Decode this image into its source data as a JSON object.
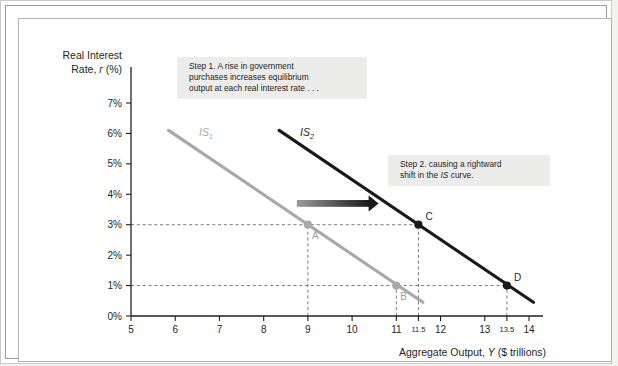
{
  "chart_data": {
    "type": "line",
    "title": "",
    "xlabel": "Aggregate Output, Y ($ trillions)",
    "xlabel_plain": "Aggregate Output,",
    "xlabel_italic": "Y",
    "xlabel_tail": "($ trillions)",
    "ylabel_line1": "Real Interest",
    "ylabel_line2_plain": "Rate,",
    "ylabel_line2_italic": "r",
    "ylabel_line2_tail": "(%)",
    "xlim": [
      5,
      14
    ],
    "ylim": [
      0,
      7
    ],
    "grid": false,
    "legend_position": "inline-curve-labels",
    "xticks": [
      5,
      6,
      7,
      8,
      9,
      10,
      11,
      12,
      13,
      14
    ],
    "xticklabels": [
      "5",
      "6",
      "7",
      "8",
      "9",
      "10",
      "11",
      "12",
      "13",
      "14"
    ],
    "xminorticks": [
      11.5,
      13.5
    ],
    "xminorticklabels": [
      "11.5",
      "13.5"
    ],
    "yticks": [
      0,
      1,
      2,
      3,
      4,
      5,
      6,
      7
    ],
    "yticklabels": [
      "0%",
      "1%",
      "2%",
      "3%",
      "4%",
      "5%",
      "6%",
      "7%"
    ],
    "series": [
      {
        "name": "IS1",
        "label_plain": "IS",
        "label_sub": "1",
        "color": "#a8a8a8",
        "x": [
          5.85,
          11.6
        ],
        "y": [
          6.1,
          0.45
        ]
      },
      {
        "name": "IS2",
        "label_plain": "IS",
        "label_sub": "2",
        "color": "#1a1a1a",
        "x": [
          8.35,
          14.1
        ],
        "y": [
          6.1,
          0.45
        ]
      }
    ],
    "points": [
      {
        "name": "A",
        "label": "A",
        "x": 9,
        "y": 3,
        "color": "#a8a8a8",
        "label_color": "#9a9a9a",
        "label_dx": 4,
        "label_dy": 14
      },
      {
        "name": "B",
        "label": "B",
        "x": 11,
        "y": 1,
        "color": "#a8a8a8",
        "label_color": "#9a9a9a",
        "label_dx": 4,
        "label_dy": 14
      },
      {
        "name": "C",
        "label": "C",
        "x": 11.5,
        "y": 3,
        "color": "#1a1a1a",
        "label_color": "#231f20",
        "label_dx": 7,
        "label_dy": -5
      },
      {
        "name": "D",
        "label": "D",
        "x": 13.5,
        "y": 1,
        "color": "#1a1a1a",
        "label_color": "#231f20",
        "label_dx": 7,
        "label_dy": -5
      }
    ],
    "guides": [
      {
        "from_axis": "y",
        "value": 3,
        "to_x": 11.5
      },
      {
        "from_axis": "y",
        "value": 1,
        "to_x": 13.5
      },
      {
        "from_axis": "x",
        "value": 9,
        "to_y": 3
      },
      {
        "from_axis": "x",
        "value": 11,
        "to_y": 1
      },
      {
        "from_axis": "x",
        "value": 11.5,
        "to_y": 3
      },
      {
        "from_axis": "x",
        "value": 13.5,
        "to_y": 1
      }
    ],
    "shift_arrow": {
      "name": "rightward-shift-arrow",
      "x_start": 8.75,
      "x_end": 10.6,
      "y": 3.7,
      "color_start": "#9a9a9a",
      "color_end": "#1a1a1a"
    },
    "annotations": [
      {
        "name": "step-1-callout",
        "lines": [
          "Step 1. A rise in government",
          "purchases increases equilibrium",
          "output at each real interest rate . . ."
        ],
        "x": 170,
        "y": 50,
        "w": 190,
        "h": 42
      },
      {
        "name": "step-2-callout",
        "lines_rich": [
          [
            {
              "t": "Step 2. causing a rightward",
              "i": false
            }
          ],
          [
            {
              "t": "shift in the ",
              "i": false
            },
            {
              "t": "IS",
              "i": true
            },
            {
              "t": " curve.",
              "i": false
            }
          ]
        ],
        "x": 381,
        "y": 148,
        "w": 162,
        "h": 31
      }
    ]
  }
}
